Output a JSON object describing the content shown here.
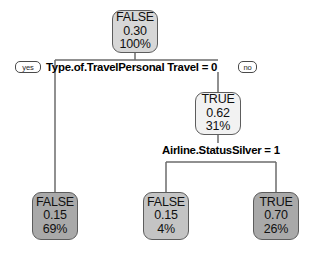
{
  "diagram": {
    "type": "decision-tree",
    "title": "",
    "background_color": "#ffffff",
    "border_color": "#5d5d5d",
    "edge_color": "#6b6b6b"
  },
  "nodes": {
    "root": {
      "id": "root",
      "label": "FALSE",
      "probability": "0.30",
      "percent": "100%",
      "fill": "#d7d7d7",
      "role": "root"
    },
    "internal_true": {
      "id": "internal_true",
      "label": "TRUE",
      "probability": "0.62",
      "percent": "31%",
      "fill": "#f2f2f2",
      "role": "internal"
    },
    "leaf_left": {
      "id": "leaf_left",
      "label": "FALSE",
      "probability": "0.15",
      "percent": "69%",
      "fill": "#a9a9a9",
      "role": "leaf"
    },
    "leaf_middle": {
      "id": "leaf_middle",
      "label": "FALSE",
      "probability": "0.15",
      "percent": "4%",
      "fill": "#c4c4c4",
      "role": "leaf"
    },
    "leaf_right": {
      "id": "leaf_right",
      "label": "TRUE",
      "probability": "0.70",
      "percent": "26%",
      "fill": "#a9a9a9",
      "role": "leaf"
    }
  },
  "splits": {
    "split_root": {
      "id": "split_root",
      "text": "Type.of.TravelPersonal Travel = 0",
      "yes_label": "yes",
      "no_label": "no"
    },
    "split_second": {
      "id": "split_second",
      "text": "Airline.StatusSilver = 1"
    }
  }
}
